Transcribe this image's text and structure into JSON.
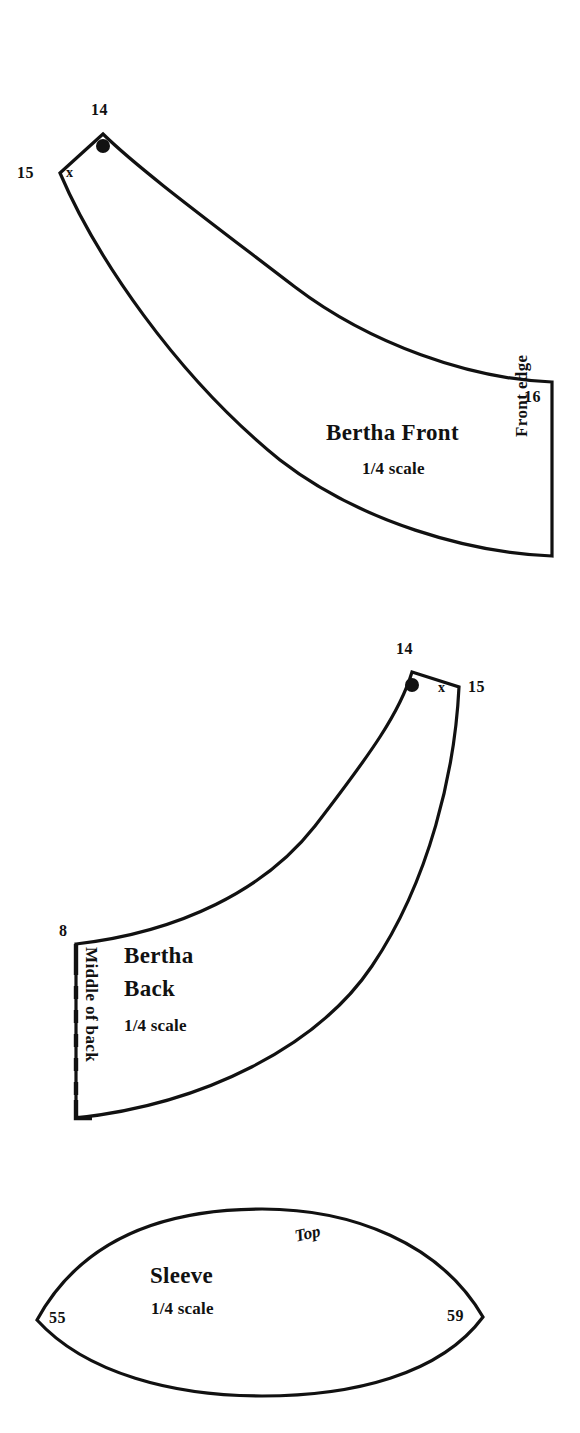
{
  "document": {
    "kind": "sewing-pattern-sheet",
    "background_color": "#ffffff",
    "ink_color": "#111111"
  },
  "pieces": [
    {
      "id": "bertha-front",
      "title": "Bertha Front",
      "scale": "1/4 scale",
      "edge_label": "Front edge",
      "x_mark": "x",
      "measurements": [
        {
          "name": "shoulder-apex",
          "value": "14"
        },
        {
          "name": "neck-corner",
          "value": "15"
        },
        {
          "name": "front-edge",
          "value": "16"
        }
      ],
      "has_dot_marker": true,
      "has_fold_line": false
    },
    {
      "id": "bertha-back",
      "title": "Bertha Back",
      "scale": "1/4 scale",
      "edge_label": "Middle of back",
      "x_mark": "x",
      "measurements": [
        {
          "name": "shoulder-apex",
          "value": "14"
        },
        {
          "name": "neck-corner",
          "value": "15"
        },
        {
          "name": "center-back",
          "value": "8"
        }
      ],
      "has_dot_marker": true,
      "has_fold_line": true
    },
    {
      "id": "sleeve",
      "title": "Sleeve",
      "scale": "1/4 scale",
      "edge_label": "Top",
      "measurements": [
        {
          "name": "left-point",
          "value": "55"
        },
        {
          "name": "right-point",
          "value": "59"
        }
      ],
      "has_dot_marker": false,
      "has_fold_line": false
    }
  ]
}
